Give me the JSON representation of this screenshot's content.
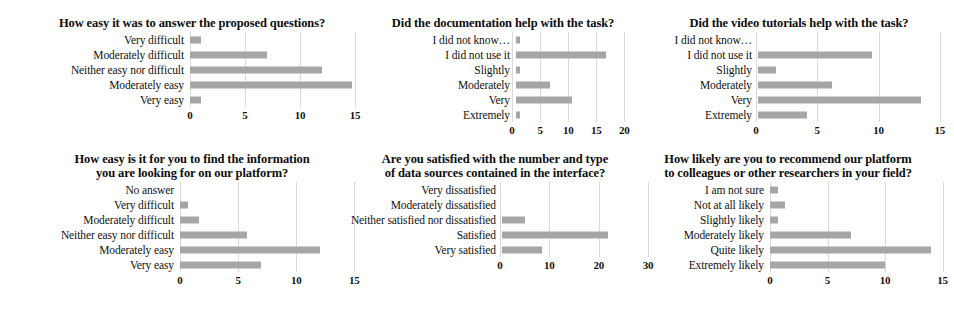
{
  "figure": {
    "bar_color": "#a6a6a6",
    "gridline_color": "#d9d9d9",
    "background": "#ffffff"
  },
  "chart_data": [
    {
      "id": "chart-1",
      "type": "bar",
      "orientation": "horizontal",
      "title": "How easy it was to answer the proposed questions?",
      "categories": [
        "Very difficult",
        "Moderately difficult",
        "Neither easy nor difficult",
        "Moderately easy",
        "Very easy"
      ],
      "values": [
        1,
        7,
        12,
        14.7,
        1
      ],
      "xlabel": "",
      "ylabel": "",
      "xlim": [
        0,
        16
      ],
      "xticks": [
        0,
        5,
        10,
        15
      ],
      "xticklabels": [
        "0",
        "5",
        "10",
        "15"
      ],
      "grid": true,
      "legend": false
    },
    {
      "id": "chart-2",
      "type": "bar",
      "orientation": "horizontal",
      "title": "Did the documentation help with the task?",
      "categories": [
        "I did not know…",
        "I did not use it",
        "Slightly",
        "Moderately",
        "Very",
        "Extremely"
      ],
      "values": [
        0.7,
        16,
        0.7,
        6,
        10,
        0.7
      ],
      "xlabel": "",
      "ylabel": "",
      "xlim": [
        0,
        21
      ],
      "xticks": [
        0,
        5,
        10,
        15,
        20
      ],
      "xticklabels": [
        "0",
        "5",
        "10",
        "15",
        "20"
      ],
      "grid": true,
      "legend": false
    },
    {
      "id": "chart-3",
      "type": "bar",
      "orientation": "horizontal",
      "title": "Did the video tutorials help with the task?",
      "categories": [
        "I did not know…",
        "I did not use it",
        "Slightly",
        "Moderately",
        "Very",
        "Extremely"
      ],
      "values": [
        0,
        9.3,
        1.5,
        6,
        13.3,
        4
      ],
      "xlabel": "",
      "ylabel": "",
      "xlim": [
        0,
        16
      ],
      "xticks": [
        0,
        5,
        10,
        15
      ],
      "xticklabels": [
        "0",
        "5",
        "10",
        "15"
      ],
      "grid": true,
      "legend": false
    },
    {
      "id": "chart-4",
      "type": "bar",
      "orientation": "horizontal",
      "title": "How easy is it for you to find the information you are looking for on our platform?",
      "title_lines": [
        "How easy is it for you to find the information",
        "you are looking for on our platform?"
      ],
      "categories": [
        "No answer",
        "Very difficult",
        "Moderately difficult",
        "Neither easy nor difficult",
        "Moderately easy",
        "Very easy"
      ],
      "values": [
        0,
        0.7,
        1.6,
        5.8,
        12,
        7
      ],
      "xlabel": "",
      "ylabel": "",
      "xlim": [
        0,
        16
      ],
      "xticks": [
        0,
        5,
        10,
        15
      ],
      "xticklabels": [
        "0",
        "5",
        "10",
        "15"
      ],
      "grid": true,
      "legend": false
    },
    {
      "id": "chart-5",
      "type": "bar",
      "orientation": "horizontal",
      "title": "Are you satisfied with the number and type of data sources contained in the interface?",
      "title_lines": [
        "Are you satisfied with the number and type",
        "of data sources contained in the interface?"
      ],
      "categories": [
        "Very dissatisfied",
        "Moderately dissatisfied",
        "Neither satisfied nor dissatisfied",
        "Satisfied",
        "Very satisfied"
      ],
      "values": [
        0,
        0,
        4.7,
        21.5,
        8
      ],
      "xlabel": "",
      "ylabel": "",
      "xlim": [
        0,
        32
      ],
      "xticks": [
        0,
        10,
        20,
        30
      ],
      "xticklabels": [
        "0",
        "10",
        "20",
        "30"
      ],
      "grid": true,
      "legend": false
    },
    {
      "id": "chart-6",
      "type": "bar",
      "orientation": "horizontal",
      "title": "How likely are you to recommend our platform to colleagues or other researchers in your field?",
      "title_lines": [
        "How likely are you to recommend our platform",
        "to colleagues or other researchers in your field?"
      ],
      "categories": [
        "I am not sure",
        "Not at all likely",
        "Slightly likely",
        "Moderately likely",
        "Quite likely",
        "Extremely likely"
      ],
      "values": [
        0.7,
        1.3,
        0.7,
        7,
        14,
        10
      ],
      "xlabel": "",
      "ylabel": "",
      "xlim": [
        0,
        16
      ],
      "xticks": [
        0,
        5,
        10,
        15
      ],
      "xticklabels": [
        "0",
        "5",
        "10",
        "15"
      ],
      "grid": true,
      "legend": false
    }
  ]
}
